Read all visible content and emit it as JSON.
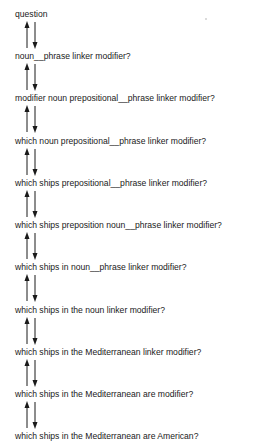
{
  "diagram": {
    "type": "derivation-chain",
    "arrow_style": "bidirectional-pair",
    "colors": {
      "text": "#1a1a1a",
      "arrow": "#1a1a1a",
      "background": "#ffffff"
    },
    "steps": [
      {
        "text": "question"
      },
      {
        "text": "noun__phrase linker modifier?"
      },
      {
        "text": "modifier noun prepositional__phrase linker modifier?"
      },
      {
        "text": "which noun prepositional__phrase linker modifier?"
      },
      {
        "text": "which ships prepositional__phrase linker modifier?"
      },
      {
        "text": "which ships preposition noun__phrase linker modifier?"
      },
      {
        "text": "which ships in noun__phrase linker modifier?"
      },
      {
        "text": "which ships in the noun linker modifier?"
      },
      {
        "text": "which ships in the Mediterranean linker modifier?"
      },
      {
        "text": "which ships in the Mediterranean are modifier?"
      },
      {
        "text": "which ships in the Mediterranean are American?"
      }
    ],
    "connectors": [
      {
        "from": 0,
        "to": 1,
        "icons": [
          "arrow-up-icon",
          "arrow-down-icon"
        ]
      },
      {
        "from": 1,
        "to": 2,
        "icons": [
          "arrow-up-icon",
          "arrow-down-icon"
        ]
      },
      {
        "from": 2,
        "to": 3,
        "icons": [
          "arrow-up-icon",
          "arrow-down-icon"
        ]
      },
      {
        "from": 3,
        "to": 4,
        "icons": [
          "arrow-up-icon",
          "arrow-down-icon"
        ]
      },
      {
        "from": 4,
        "to": 5,
        "icons": [
          "arrow-up-icon",
          "arrow-down-icon"
        ]
      },
      {
        "from": 5,
        "to": 6,
        "icons": [
          "arrow-up-icon",
          "arrow-down-icon"
        ]
      },
      {
        "from": 6,
        "to": 7,
        "icons": [
          "arrow-up-icon",
          "arrow-down-icon"
        ]
      },
      {
        "from": 7,
        "to": 8,
        "icons": [
          "arrow-up-icon",
          "arrow-down-icon"
        ]
      },
      {
        "from": 8,
        "to": 9,
        "icons": [
          "arrow-up-icon",
          "arrow-down-icon"
        ]
      },
      {
        "from": 9,
        "to": 10,
        "icons": [
          "arrow-up-icon",
          "arrow-down-icon"
        ]
      }
    ]
  }
}
